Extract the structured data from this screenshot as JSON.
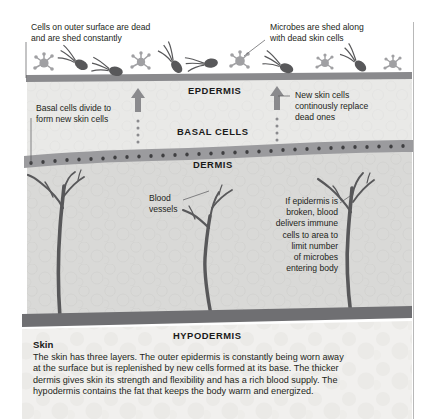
{
  "figure": {
    "annotations": [
      {
        "name": "cells-outer-surface",
        "text": "Cells on outer surface are dead\nand are shed constantly",
        "align": "left"
      },
      {
        "name": "microbes-shed",
        "text": "Microbes are shed along\nwith dead skin cells",
        "align": "left"
      },
      {
        "name": "basal-cells-divide",
        "text": "Basal cells divide to\nform new skin cells",
        "align": "left"
      },
      {
        "name": "new-skin-cells",
        "text": "New skin cells\ncontinously replace\ndead ones",
        "align": "left"
      },
      {
        "name": "blood-vessels",
        "text": "Blood\nvessels",
        "align": "left"
      },
      {
        "name": "immune-response",
        "text": "If epidermis is\nbroken, blood\ndelivers immune\ncells to area to\nlimit number\nof microbes\nentering body",
        "align": "right"
      }
    ],
    "layer_labels": [
      {
        "name": "epidermis",
        "text": "EPDERMIS"
      },
      {
        "name": "basal-cells",
        "text": "BASAL CELLS"
      },
      {
        "name": "dermis",
        "text": "DERMIS"
      },
      {
        "name": "hypodermis",
        "text": "HYPODERMIS"
      }
    ]
  },
  "caption": {
    "heading": "Skin",
    "body": "The skin has three layers. The outer epidermis is constantly being worn away at the surface but is replenished by new cells formed at its base. The thicker dermis gives skin its strength and flexibility and has a rich blood supply. The hypodermis contains the fat that keeps the body warm and energized."
  },
  "colors": {
    "ink": "#231f20",
    "surface_band": "#8a8a8d",
    "basal_band": "#9b9b9e",
    "dermis_fill": "#d8d8d6",
    "hypodermis_fill": "#f0efed",
    "vessel": "#58585a",
    "microbe": "#a0a0a3",
    "bacteria": "#58585a",
    "border": "#b8b8b8"
  }
}
